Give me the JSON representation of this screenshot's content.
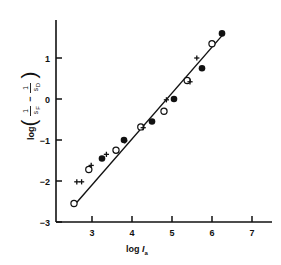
{
  "chart_data": {
    "type": "scatter",
    "title": "",
    "xlabel": "log Iₐ",
    "ylabel": "log(1/s_F − 1/s_D)",
    "xlabel_parts": {
      "log": "log",
      "symbol": "I",
      "subscript": "a"
    },
    "ylabel_parts": {
      "log": "log",
      "open_paren": "(",
      "num1": "1",
      "den1": "s",
      "den1_sub": "F",
      "minus": "−",
      "num2": "1",
      "den2": "s",
      "den2_sub": "D",
      "close_paren": ")"
    },
    "xlim": [
      2.3,
      7.4
    ],
    "ylim": [
      -3,
      1.55
    ],
    "xticks": [
      3,
      4,
      5,
      6,
      7
    ],
    "xtick_labels": [
      "3",
      "4",
      "5",
      "6",
      "7"
    ],
    "yticks": [
      -3,
      -2,
      -1,
      0,
      1
    ],
    "ytick_labels": [
      "−3",
      "−2",
      "−1",
      "0",
      "1"
    ],
    "grid": false,
    "legend": "none",
    "axis_style": "left-and-bottom-spines",
    "fit_line": {
      "name": "regression line",
      "x_start": 2.53,
      "y_start": -2.62,
      "x_end": 6.3,
      "y_end": 1.6,
      "slope": 1.12,
      "intercept": -5.45
    },
    "series": [
      {
        "name": "filled circles",
        "marker": "filled-circle",
        "points": [
          [
            3.25,
            -1.45
          ],
          [
            3.8,
            -1.0
          ],
          [
            4.5,
            -0.55
          ],
          [
            5.05,
            0.0
          ],
          [
            5.75,
            0.75
          ],
          [
            6.25,
            1.6
          ]
        ]
      },
      {
        "name": "open circles",
        "marker": "open-circle",
        "points": [
          [
            2.55,
            -2.55
          ],
          [
            2.92,
            -1.72
          ],
          [
            3.6,
            -1.25
          ],
          [
            4.22,
            -0.68
          ],
          [
            4.8,
            -0.3
          ],
          [
            5.38,
            0.45
          ],
          [
            6.0,
            1.35
          ]
        ]
      },
      {
        "name": "plus / cross markers",
        "marker": "plus",
        "points": [
          [
            2.62,
            -2.02
          ],
          [
            2.74,
            -2.02
          ],
          [
            2.98,
            -1.62
          ],
          [
            3.36,
            -1.35
          ],
          [
            3.82,
            -1.02
          ],
          [
            4.28,
            -0.7
          ],
          [
            4.86,
            -0.02
          ],
          [
            5.45,
            0.42
          ],
          [
            5.62,
            1.0
          ]
        ]
      }
    ]
  },
  "axes": {
    "x_axis_name": "x-axis",
    "y_axis_name": "y-axis"
  }
}
